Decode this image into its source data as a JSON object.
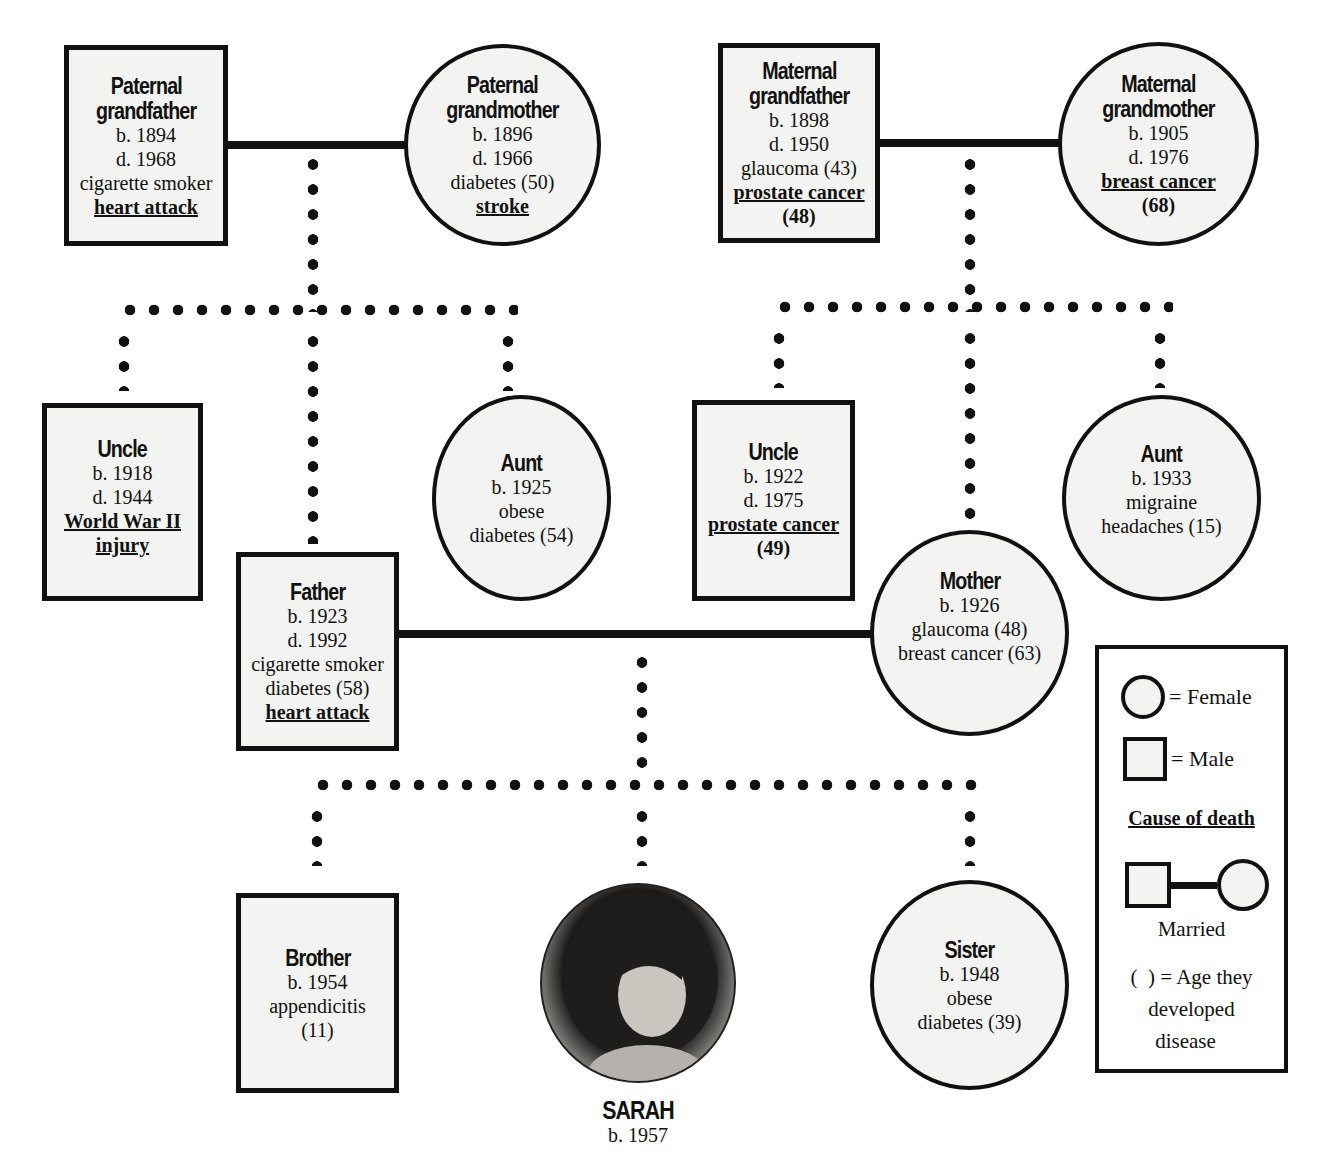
{
  "diagram": {
    "type": "family-health-pedigree",
    "subject": {
      "name": "SARAH",
      "born": "b. 1957",
      "photo": "portrait-photo"
    },
    "paternal_grandfather": {
      "title_line1": "Paternal",
      "title_line2": "grandfather",
      "born": "b. 1894",
      "died": "d. 1968",
      "notes": [
        "cigarette smoker"
      ],
      "cause_of_death": "heart attack"
    },
    "paternal_grandmother": {
      "title_line1": "Paternal",
      "title_line2": "grandmother",
      "born": "b. 1896",
      "died": "d. 1966",
      "notes": [
        "diabetes (50)"
      ],
      "cause_of_death": "stroke"
    },
    "maternal_grandfather": {
      "title_line1": "Maternal",
      "title_line2": "grandfather",
      "born": "b. 1898",
      "died": "d. 1950",
      "notes": [
        "glaucoma (43)"
      ],
      "cause_of_death": "prostate cancer",
      "cause_age": "(48)"
    },
    "maternal_grandmother": {
      "title_line1": "Maternal",
      "title_line2": "grandmother",
      "born": "b. 1905",
      "died": "d. 1976",
      "cause_of_death": "breast cancer",
      "cause_age": "(68)"
    },
    "paternal_uncle": {
      "title": "Uncle",
      "born": "b. 1918",
      "died": "d. 1944",
      "cause_of_death_line1": "World War II",
      "cause_of_death_line2": "injury"
    },
    "paternal_aunt": {
      "title": "Aunt",
      "born": "b. 1925",
      "notes": [
        "obese",
        "diabetes (54)"
      ]
    },
    "father": {
      "title": "Father",
      "born": "b. 1923",
      "died": "d. 1992",
      "notes": [
        "cigarette smoker",
        "diabetes (58)"
      ],
      "cause_of_death": "heart attack"
    },
    "maternal_uncle": {
      "title": "Uncle",
      "born": "b. 1922",
      "died": "d. 1975",
      "cause_of_death": "prostate cancer",
      "cause_age": "(49)"
    },
    "maternal_aunt": {
      "title": "Aunt",
      "born": "b. 1933",
      "notes": [
        "migraine",
        "headaches (15)"
      ]
    },
    "mother": {
      "title": "Mother",
      "born": "b. 1926",
      "notes": [
        "glaucoma (48)",
        "breast cancer (63)"
      ]
    },
    "brother": {
      "title": "Brother",
      "born": "b. 1954",
      "notes": [
        "appendicitis",
        "(11)"
      ]
    },
    "sister": {
      "title": "Sister",
      "born": "b. 1948",
      "notes": [
        "obese",
        "diabetes (39)"
      ]
    }
  },
  "legend": {
    "female": "= Female",
    "male": "= Male",
    "cause_of_death": "Cause of death",
    "married": "Married",
    "age_line1": "(  ) = Age they",
    "age_line2": "developed",
    "age_line3": "disease"
  },
  "colors": {
    "stroke": "#111111",
    "shape_fill": "#f3f3f1",
    "background": "#ffffff"
  }
}
